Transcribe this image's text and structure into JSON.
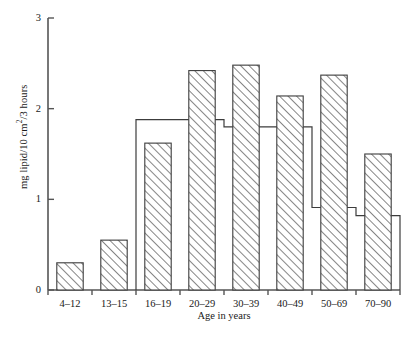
{
  "chart_data": {
    "type": "bar",
    "title": "",
    "xlabel": "Age in years",
    "ylabel": "mg lipid/10 cm2/3 hours",
    "ylabel_parts": {
      "prefix": "mg lipid/10 cm",
      "superscript": "2",
      "suffix": "/3 hours"
    },
    "categories": [
      "4–12",
      "13–15",
      "16–19",
      "20–29",
      "30–39",
      "40–49",
      "50–69",
      "70–90"
    ],
    "ylim": [
      0,
      3
    ],
    "xlim": [
      0,
      8
    ],
    "yticks": [
      0,
      1,
      2,
      3
    ],
    "ytick_labels": [
      "0",
      "1",
      "2",
      "3"
    ],
    "grid": false,
    "legend": "none",
    "series": [
      {
        "name": "hatched",
        "style": "filled-hatched-bars",
        "values": [
          0.3,
          0.55,
          1.62,
          2.42,
          2.48,
          2.14,
          2.37,
          1.5
        ]
      },
      {
        "name": "open",
        "style": "open-outline-step",
        "values": [
          null,
          null,
          1.88,
          1.88,
          1.8,
          1.8,
          0.91,
          0.82
        ]
      }
    ]
  },
  "figure": {
    "caption": ""
  },
  "colors": {
    "axis": "#555555",
    "bar_outline": "#3c3c3c",
    "hatch": "#707070",
    "open_outline": "#3c3c3c",
    "text": "#1a1a1a",
    "background": "#ffffff"
  }
}
